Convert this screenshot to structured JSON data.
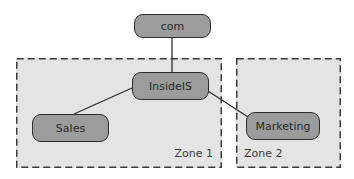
{
  "diagram": {
    "type": "hierarchy",
    "colors": {
      "zone_fill": "#e4e4e4",
      "zone_border": "#3a3a3a",
      "node_fill": "#9c9c9c",
      "node_border": "#2e2e2e",
      "edge": "#2e2e2e",
      "text": "#2a2a2a"
    },
    "zones": [
      {
        "id": "zone1",
        "label": "Zone 1"
      },
      {
        "id": "zone2",
        "label": "Zone 2"
      }
    ],
    "nodes": [
      {
        "id": "com",
        "label": "com",
        "zone": null
      },
      {
        "id": "insideis",
        "label": "InsideIS",
        "zone": "zone1"
      },
      {
        "id": "sales",
        "label": "Sales",
        "zone": "zone1"
      },
      {
        "id": "marketing",
        "label": "Marketing",
        "zone": "zone2"
      }
    ],
    "edges": [
      {
        "from": "com",
        "to": "insideis"
      },
      {
        "from": "insideis",
        "to": "sales"
      },
      {
        "from": "insideis",
        "to": "marketing"
      }
    ]
  }
}
